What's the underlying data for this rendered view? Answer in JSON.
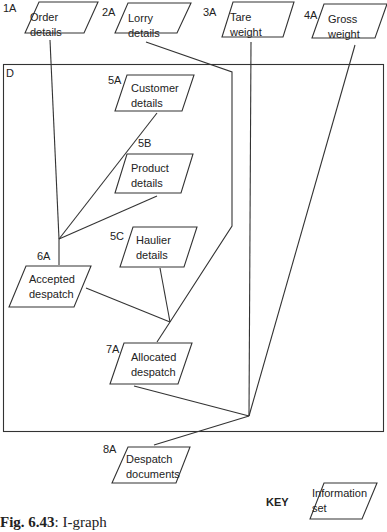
{
  "diagram": {
    "type": "I-graph",
    "boundary": {
      "label": "D"
    },
    "nodes": [
      {
        "id": "1A",
        "line1": "Order",
        "line2": "details"
      },
      {
        "id": "2A",
        "line1": "Lorry",
        "line2": "details"
      },
      {
        "id": "3A",
        "line1": "Tare",
        "line2": "weight"
      },
      {
        "id": "4A",
        "line1": "Gross",
        "line2": "weight"
      },
      {
        "id": "5A",
        "line1": "Customer",
        "line2": "details"
      },
      {
        "id": "5B",
        "line1": "Product",
        "line2": "details"
      },
      {
        "id": "5C",
        "line1": "Haulier",
        "line2": "details"
      },
      {
        "id": "6A",
        "line1": "Accepted",
        "line2": "despatch"
      },
      {
        "id": "7A",
        "line1": "Allocated",
        "line2": "despatch"
      },
      {
        "id": "8A",
        "line1": "Despatch",
        "line2": "documents"
      }
    ],
    "edges": [
      {
        "from": [
          "1A",
          "5A",
          "5B"
        ],
        "to": "6A"
      },
      {
        "from": [
          "6A",
          "5C",
          "2A"
        ],
        "to": "7A"
      },
      {
        "from": [
          "7A",
          "3A",
          "4A"
        ],
        "to": "8A"
      }
    ],
    "key": {
      "label": "KEY",
      "line1": "Information",
      "line2": "set"
    },
    "caption": {
      "prefix": "Fig. 6.43",
      "text": ": I-graph"
    }
  }
}
